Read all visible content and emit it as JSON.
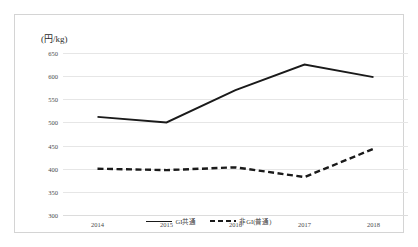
{
  "chart_data": {
    "type": "line",
    "title": "",
    "xlabel": "",
    "ylabel": "(円/kg)",
    "categories": [
      "2014",
      "2015",
      "2016",
      "2017",
      "2018"
    ],
    "ylim": [
      300,
      650
    ],
    "yticks": [
      300,
      350,
      400,
      450,
      500,
      550,
      600,
      650
    ],
    "ytick_labels": [
      "300",
      "350",
      "400",
      "450",
      "500",
      "550",
      "600",
      "650"
    ],
    "grid": true,
    "legend_position": "bottom-center",
    "series": [
      {
        "name": "GI共通",
        "style": "solid",
        "color": "#1a1a1a",
        "values": [
          512,
          500,
          570,
          625,
          598
        ]
      },
      {
        "name": "非GI(普通)",
        "style": "dashed",
        "color": "#1a1a1a",
        "values": [
          400,
          397,
          403,
          382,
          443
        ]
      }
    ]
  },
  "legend": {
    "items": [
      {
        "label": "GI共通",
        "style": "solid"
      },
      {
        "label": "非GI(普通)",
        "style": "dashed"
      }
    ]
  }
}
